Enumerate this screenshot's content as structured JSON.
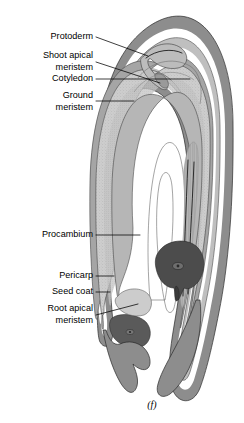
{
  "figure": {
    "caption": "(f)"
  },
  "labels": [
    {
      "id": "protoderm",
      "text": "Protoderm",
      "text2": "",
      "name": "label-protoderm"
    },
    {
      "id": "shoot-apical-meristem",
      "text": "Shoot apical",
      "text2": "meristem",
      "name": "label-shoot-apical-meristem"
    },
    {
      "id": "cotyledon",
      "text": "Cotyledon",
      "text2": "",
      "name": "label-cotyledon"
    },
    {
      "id": "ground-meristem",
      "text": "Ground",
      "text2": "meristem",
      "name": "label-ground-meristem"
    },
    {
      "id": "procambium",
      "text": "Procambium",
      "text2": "",
      "name": "label-procambium"
    },
    {
      "id": "pericarp",
      "text": "Pericarp",
      "text2": "",
      "name": "label-pericarp"
    },
    {
      "id": "seed-coat",
      "text": "Seed coat",
      "text2": "",
      "name": "label-seed-coat"
    },
    {
      "id": "root-apical-meristem",
      "text": "Root apical",
      "text2": "meristem",
      "name": "label-root-apical-meristem"
    }
  ],
  "colors": {
    "background": "#ffffff",
    "pericarp": "#8d8d8d",
    "seed_coat": "#bdbdbd",
    "ground_meristem": "#c9c9c9",
    "cotyledon": "#b9b9b9",
    "procambium": "#a8a8a8",
    "root_apical_meristem": "#4c4c4c",
    "protoderm": "#9a9a9a",
    "outline": "#2a2a2a",
    "label_text": "#000000"
  }
}
